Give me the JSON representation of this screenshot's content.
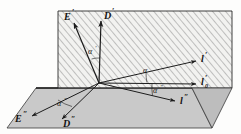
{
  "figure": {
    "background_color": "#fdfdfc",
    "planes": [
      {
        "name": "inclined-hatched-plane",
        "fill": "#efefef",
        "hatch_color": "#8c8c8c",
        "outline_color": "#2a2a2a",
        "description": "hatched quadrilateral (inclined / vertical plane)"
      },
      {
        "name": "horizontal-ground-plane",
        "fill": "#c9c9c9",
        "outline_color": "#2a2a2a",
        "description": "grey parallelogram (horizontal plane)"
      }
    ],
    "origin_label": "O",
    "vectors": [
      {
        "id": "E_prime",
        "base": "E",
        "prime": "′",
        "sub": "",
        "plane": "inclined"
      },
      {
        "id": "D_prime",
        "base": "D",
        "prime": "′",
        "sub": "",
        "plane": "inclined"
      },
      {
        "id": "l_prime",
        "base": "l",
        "prime": "′",
        "sub": "",
        "plane": "inclined"
      },
      {
        "id": "l0_prime",
        "base": "l",
        "prime": "′",
        "sub": "0",
        "plane": "inclined"
      },
      {
        "id": "l_dprime",
        "base": "l",
        "prime": "″",
        "sub": "",
        "plane": "horizontal"
      },
      {
        "id": "E_dprime",
        "base": "E",
        "prime": "″",
        "sub": "",
        "plane": "horizontal"
      },
      {
        "id": "D_dprime",
        "base": "D",
        "prime": "″",
        "sub": "",
        "plane": "horizontal"
      }
    ],
    "angles": [
      {
        "id": "alpha_prime_top",
        "base": "α",
        "prime": "′",
        "between": [
          "E_prime",
          "D_prime"
        ]
      },
      {
        "id": "alpha_mid",
        "base": "α",
        "prime": "",
        "between": [
          "l_prime",
          "l0_prime"
        ]
      },
      {
        "id": "alpha_dprime_right",
        "base": "α",
        "prime": "″",
        "between": [
          "l0_prime",
          "l_dprime"
        ]
      },
      {
        "id": "alpha_dprime_left",
        "base": "α",
        "prime": "″",
        "between": [
          "E_dprime",
          "D_dprime"
        ]
      }
    ]
  }
}
